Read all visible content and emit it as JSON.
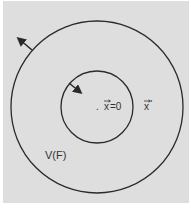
{
  "diagram": {
    "background_color": "#dedede",
    "line_color": "#2a2a2a",
    "outer_circle": {
      "cx": 97,
      "cy": 107,
      "r": 86
    },
    "inner_circle": {
      "cx": 97,
      "cy": 107,
      "r": 36
    },
    "outer_arrow": {
      "from": [
        32,
        50
      ],
      "to": [
        17,
        37
      ],
      "direction": "outward"
    },
    "inner_arrow": {
      "from": [
        69,
        83
      ],
      "to": [
        82,
        93
      ],
      "direction": "inward"
    },
    "labels": {
      "origin": "x⃗=0",
      "origin_vector": "x",
      "origin_value": "=0",
      "origin_dot": ".",
      "field_point": "x⃗'",
      "field_point_vector": "x",
      "field_point_prime": "'",
      "region": "V(F)"
    }
  }
}
